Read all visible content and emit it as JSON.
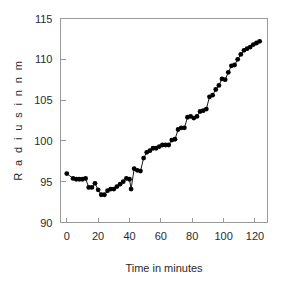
{
  "figure": {
    "background_color": "#ffffff",
    "frame_color": "#9a9a9a",
    "marker_color": "#000000",
    "line_color": "#000000"
  },
  "chart_data": {
    "type": "scatter",
    "title": "",
    "subtitle": "",
    "xlabel": "Time in minutes",
    "ylabel": "R a d i u s   i n   n m",
    "ylabel_plain": "Radius in nm",
    "xlim": [
      -4,
      128
    ],
    "ylim": [
      90,
      115
    ],
    "xticks": [
      0,
      20,
      40,
      60,
      80,
      100,
      120
    ],
    "xtick_labels": [
      "0",
      "20",
      "40",
      "60",
      "80",
      "100",
      "120"
    ],
    "yticks": [
      90,
      95,
      100,
      105,
      110,
      115
    ],
    "ytick_labels": [
      "90",
      "95",
      "100",
      "105",
      "110",
      "115"
    ],
    "grid": false,
    "legend": null,
    "legend_position": "none",
    "marker": "filled-circle",
    "marker_size": 4.6,
    "connected": true,
    "series": [
      {
        "name": "Radius",
        "x": [
          0,
          4,
          6,
          8,
          10,
          12,
          14,
          16,
          18,
          20,
          22,
          24,
          26,
          28,
          30,
          32,
          34,
          36,
          38,
          40,
          41,
          43,
          45,
          47,
          49,
          51,
          53,
          55,
          57,
          59,
          61,
          63,
          65,
          67,
          69,
          71,
          73,
          75,
          77,
          79,
          81,
          83,
          85,
          87,
          89,
          91,
          93,
          95,
          97,
          99,
          101,
          103,
          105,
          107,
          109,
          111,
          113,
          115,
          117,
          119,
          121,
          123
        ],
        "y": [
          96.0,
          95.4,
          95.3,
          95.3,
          95.3,
          95.4,
          94.3,
          94.3,
          94.8,
          94.0,
          93.4,
          93.4,
          93.9,
          94.1,
          94.1,
          94.4,
          94.7,
          95.0,
          95.4,
          95.3,
          94.1,
          96.6,
          96.4,
          96.3,
          97.9,
          98.6,
          98.8,
          99.1,
          99.1,
          99.3,
          99.5,
          99.5,
          99.5,
          100.1,
          100.2,
          101.4,
          101.6,
          101.6,
          102.9,
          103.0,
          102.8,
          103.0,
          103.6,
          103.7,
          103.9,
          105.4,
          105.6,
          106.3,
          106.8,
          107.6,
          107.5,
          108.4,
          109.2,
          109.3,
          110.0,
          110.6,
          111.1,
          111.3,
          111.5,
          111.8,
          112.0,
          112.2
        ]
      }
    ]
  }
}
